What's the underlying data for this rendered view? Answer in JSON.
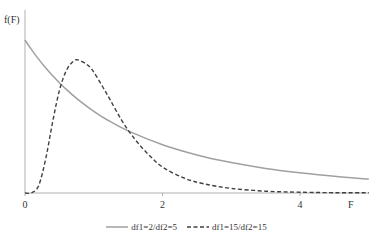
{
  "chart_data": {
    "type": "line",
    "title": "",
    "xlabel": "F",
    "ylabel": "f(F)",
    "xlim": [
      0,
      5
    ],
    "ylim": [
      0,
      1.0
    ],
    "grid": false,
    "legend_position": "bottom",
    "x_ticks": [
      "0",
      "2",
      "4"
    ],
    "x_tick_values": [
      0,
      2,
      4
    ],
    "series": [
      {
        "name": "df1=2/df2=5",
        "style": "solid",
        "color": "#a0a0a0",
        "x": [
          0,
          0.1,
          0.2,
          0.3,
          0.4,
          0.5,
          0.6,
          0.8,
          1.0,
          1.2,
          1.5,
          2.0,
          2.5,
          3.0,
          3.5,
          4.0,
          4.5,
          5.0
        ],
        "values": [
          1.0,
          0.934,
          0.873,
          0.818,
          0.767,
          0.72,
          0.677,
          0.6,
          0.534,
          0.477,
          0.406,
          0.316,
          0.249,
          0.199,
          0.161,
          0.132,
          0.109,
          0.091
        ]
      },
      {
        "name": "df1=15/df2=15",
        "style": "dashed",
        "color": "#404040",
        "x": [
          0,
          0.1,
          0.2,
          0.3,
          0.4,
          0.5,
          0.6,
          0.7,
          0.77,
          0.9,
          1.0,
          1.2,
          1.4,
          1.6,
          1.8,
          2.0,
          2.3,
          2.6,
          3.0,
          3.5,
          4.0,
          4.5,
          5.0
        ],
        "values": [
          0,
          0.002,
          0.05,
          0.22,
          0.46,
          0.67,
          0.8,
          0.86,
          0.87,
          0.84,
          0.79,
          0.64,
          0.48,
          0.35,
          0.25,
          0.17,
          0.1,
          0.06,
          0.03,
          0.012,
          0.005,
          0.002,
          0.001
        ]
      }
    ]
  },
  "axes": {
    "y_label": "f(F)",
    "x_label": "F",
    "x_ticks": [
      {
        "label": "0",
        "px": 25
      },
      {
        "label": "2",
        "px": 162
      },
      {
        "label": "4",
        "px": 300
      }
    ]
  },
  "legend": {
    "items": [
      {
        "label": "df1=2/df2=5",
        "style": "solid",
        "color": "#a0a0a0"
      },
      {
        "label": "df1=15/df2=15",
        "style": "dashed",
        "color": "#404040"
      }
    ]
  }
}
